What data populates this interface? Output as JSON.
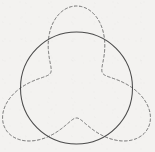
{
  "figure": {
    "title": "",
    "caption": "",
    "background_color": "#f3f2f0",
    "width": 155,
    "height": 152
  },
  "chart_data": {
    "type": "line",
    "title": "",
    "subtitle": "",
    "xlabel": "",
    "ylabel": "",
    "xlim": [
      0,
      155
    ],
    "ylim": [
      0,
      152
    ],
    "grid": false,
    "legend": null,
    "series": [
      {
        "name": "circle",
        "shape": "circle",
        "style": "solid",
        "color": "#4b4b4b",
        "line_width": 1,
        "center": [
          76.5,
          88.0
        ],
        "radius": 56.0,
        "values": []
      },
      {
        "name": "trefoil",
        "shape": "trefoil",
        "style": "dashed",
        "color": "#6e6e6e",
        "line_width": 1,
        "dash_pattern": [
          2.6,
          2.4
        ],
        "center": [
          76.5,
          88.0
        ],
        "equation": "r(t) = r0 + r1*cos(3t)",
        "r0": 56.0,
        "r1": 26.0,
        "phase_deg": 90,
        "lobe_tips": [
          [
            76.5,
            6.0
          ],
          [
            5.5,
            129.0
          ],
          [
            147.5,
            129.0
          ]
        ],
        "waist_points": [
          [
            21.0,
            61.0
          ],
          [
            132.0,
            61.0
          ],
          [
            76.5,
            118.0
          ]
        ],
        "values": []
      }
    ]
  },
  "colors": {
    "background": "#f3f2f0",
    "solid_stroke": "#4b4b4b",
    "dashed_stroke": "#6e6e6e"
  }
}
